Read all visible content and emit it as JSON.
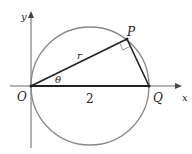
{
  "diagram": {
    "labels": {
      "y_axis": "y",
      "x_axis": "x",
      "origin": "O",
      "point_p": "P",
      "point_q": "Q",
      "radius": "r",
      "angle": "θ",
      "length_oq": "2"
    },
    "colors": {
      "circle": "#888888",
      "lines": "#222222",
      "axes": "#666666"
    }
  }
}
